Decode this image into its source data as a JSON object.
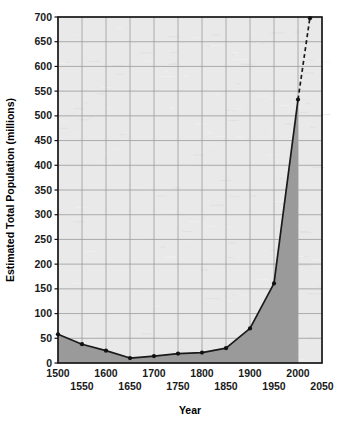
{
  "chart_data": {
    "type": "line",
    "title": "",
    "xlabel": "Year",
    "ylabel": "Estimated Total Population (millions)",
    "xlim": [
      1500,
      2050
    ],
    "ylim": [
      0,
      700
    ],
    "ytick_step": 50,
    "xtick_step": 50,
    "grid": true,
    "legend": "none",
    "fill": "area-under-curve",
    "x": [
      1500,
      1550,
      1600,
      1650,
      1700,
      1750,
      1800,
      1850,
      1900,
      1950,
      2000
    ],
    "values": [
      58,
      38,
      25,
      10,
      14,
      19,
      21,
      30,
      70,
      161,
      533
    ],
    "series": [
      {
        "name": "Estimated Total Population",
        "style": "solid",
        "x": [
          1500,
          1550,
          1600,
          1650,
          1700,
          1750,
          1800,
          1850,
          1900,
          1950,
          2000
        ],
        "values": [
          58,
          38,
          25,
          10,
          14,
          19,
          21,
          30,
          70,
          161,
          533
        ]
      },
      {
        "name": "Projection",
        "style": "dashed",
        "x": [
          2000,
          2025
        ],
        "values": [
          533,
          700
        ]
      }
    ],
    "yticks": [
      0,
      50,
      100,
      150,
      200,
      250,
      300,
      350,
      400,
      450,
      500,
      550,
      600,
      650,
      700
    ],
    "ytick_labels": [
      "0",
      "50",
      "100",
      "150",
      "200",
      "250",
      "300",
      "350",
      "400",
      "450",
      "500",
      "550",
      "600",
      "650",
      "700"
    ],
    "xticks": [
      1500,
      1550,
      1600,
      1650,
      1700,
      1750,
      1800,
      1850,
      1900,
      1950,
      2000,
      2050
    ],
    "xtick_labels": [
      "1500",
      "1550",
      "1600",
      "1650",
      "1700",
      "1750",
      "1800",
      "1850",
      "1900",
      "1950",
      "2000",
      "2050"
    ],
    "xtick_rows": [
      0,
      1,
      0,
      1,
      0,
      1,
      0,
      1,
      0,
      1,
      0,
      1
    ],
    "colors": {
      "plot_background": "#e9e9e9",
      "grid": "#9a9a9a",
      "area_fill": "#9a9a9a",
      "line": "#1a1a1a",
      "marker": "#111111",
      "axis": "#111111",
      "text": "#000000",
      "page_background": "#ffffff"
    }
  }
}
